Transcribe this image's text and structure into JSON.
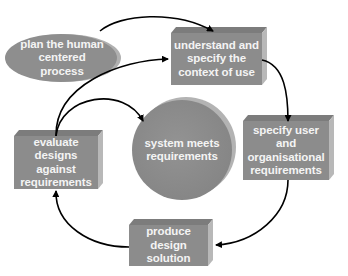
{
  "diagram": {
    "colors": {
      "shape_fill": "#8c8c8c",
      "shape_top": "#7a7a7a",
      "shape_side": "#b5b5b5",
      "text": "#f4f4f4",
      "arrow": "#000000",
      "background": "#ffffff"
    },
    "nodes": [
      {
        "id": "plan",
        "shape": "ellipse",
        "label": "plan the human centered process",
        "lines": [
          "plan the human",
          "centered",
          "process"
        ]
      },
      {
        "id": "understand",
        "shape": "box",
        "label": "understand and specify the context of use",
        "lines": [
          "understand and",
          "specify the",
          "context of use"
        ]
      },
      {
        "id": "specify",
        "shape": "box",
        "label": "specify user and organisational requirements",
        "lines": [
          "specify user and",
          "organisational",
          "requirements"
        ]
      },
      {
        "id": "produce",
        "shape": "box",
        "label": "produce design solution",
        "lines": [
          "produce design",
          "solution"
        ]
      },
      {
        "id": "evaluate",
        "shape": "box",
        "label": "evaluate designs against requirements",
        "lines": [
          "evaluate designs",
          "against",
          "requirements"
        ]
      },
      {
        "id": "meets",
        "shape": "circle",
        "label": "system meets requirements",
        "lines": [
          "system meets",
          "requirements"
        ]
      }
    ],
    "edges": [
      {
        "from": "plan",
        "to": "understand"
      },
      {
        "from": "understand",
        "to": "specify"
      },
      {
        "from": "specify",
        "to": "produce"
      },
      {
        "from": "produce",
        "to": "evaluate"
      },
      {
        "from": "evaluate",
        "to": "understand"
      },
      {
        "from": "evaluate",
        "to": "meets"
      }
    ]
  }
}
